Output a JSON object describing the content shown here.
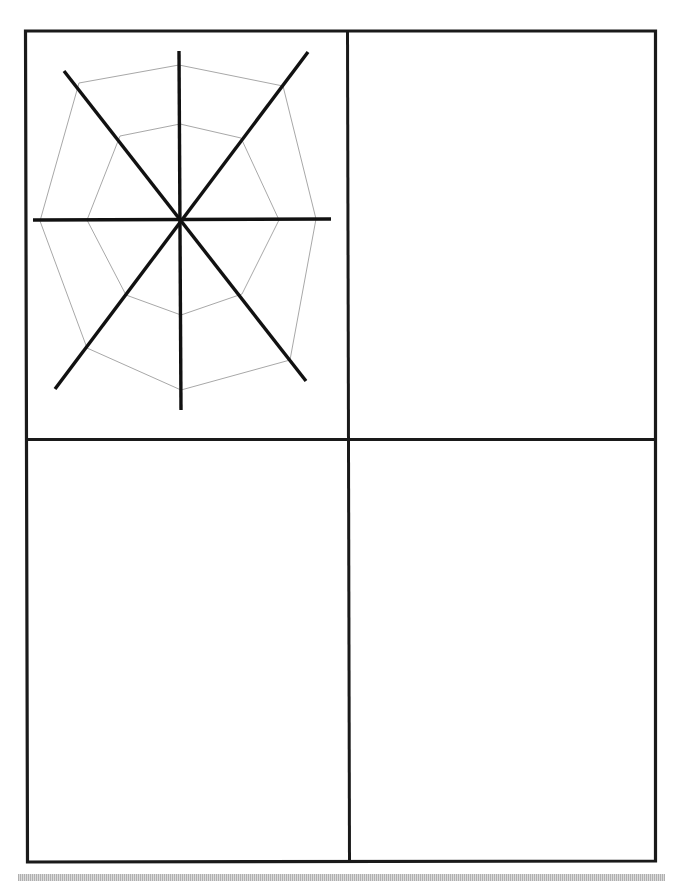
{
  "worksheet": {
    "layout": "2x2 drawing grid",
    "panels": [
      {
        "position": "top-left",
        "content": "spider-web drawing",
        "filled": true
      },
      {
        "position": "top-right",
        "content": "",
        "filled": false
      },
      {
        "position": "bottom-left",
        "content": "",
        "filled": false
      },
      {
        "position": "bottom-right",
        "content": "",
        "filled": false
      }
    ],
    "colors": {
      "border": "#1a1a1a",
      "spokes": "#111111",
      "web_threads": "#a8a8a8",
      "background": "#ffffff",
      "footer_band": "#c9c9c9"
    }
  }
}
